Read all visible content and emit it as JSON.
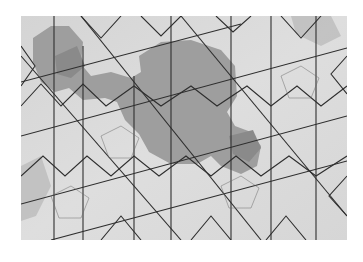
{
  "image": {
    "description": "Photograph of a geometric girih-style tiling with darker shaded polygonal regions",
    "colors": {
      "background": "#ffffff",
      "tile_light": "#d9d9d9",
      "tile_mid": "#a8a8a8",
      "tile_dark": "#8c8c8c",
      "line": "#2b2b2b"
    }
  }
}
